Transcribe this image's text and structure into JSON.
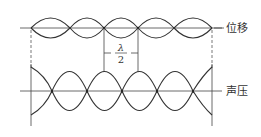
{
  "diagram": {
    "top_wave": {
      "label": "位移",
      "axis_y": 28,
      "amplitude": 10,
      "nodes_x": [
        31,
        70,
        104,
        138,
        174,
        212
      ]
    },
    "bottom_wave": {
      "label": "声压",
      "axis_y": 91,
      "amplitude": 24,
      "nodes_x": [
        52,
        87,
        122,
        157,
        193
      ],
      "bound_left_x": 31,
      "bound_right_x": 212
    },
    "annotation": {
      "numerator": "λ",
      "denominator": "2",
      "from_x": 104,
      "to_x": 138
    },
    "colors": {
      "stroke": "#333333",
      "background": "#ffffff"
    }
  }
}
